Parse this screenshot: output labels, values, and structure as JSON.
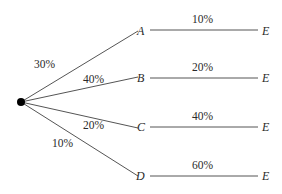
{
  "diagram": {
    "type": "probability-tree",
    "root": {
      "x": 21,
      "y": 102
    },
    "first_stage": [
      {
        "node": "A",
        "probability": "30%",
        "x": 143,
        "y": 31,
        "label_x": 34,
        "label_y": 58
      },
      {
        "node": "B",
        "probability": "40%",
        "x": 143,
        "y": 78,
        "label_x": 83,
        "label_y": 75
      },
      {
        "node": "C",
        "probability": "20%",
        "x": 143,
        "y": 127,
        "label_x": 83,
        "label_y": 120
      },
      {
        "node": "D",
        "probability": "10%",
        "x": 143,
        "y": 176,
        "label_x": 51,
        "label_y": 138
      }
    ],
    "second_stage": [
      {
        "from": "A",
        "to": "E",
        "probability": "10%"
      },
      {
        "from": "B",
        "to": "E",
        "probability": "20%"
      },
      {
        "from": "C",
        "to": "E",
        "probability": "40%"
      },
      {
        "from": "D",
        "to": "E",
        "probability": "60%"
      }
    ],
    "colors": {
      "line": "#555555",
      "text": "#2a2a2a",
      "dot": "#000000"
    }
  }
}
